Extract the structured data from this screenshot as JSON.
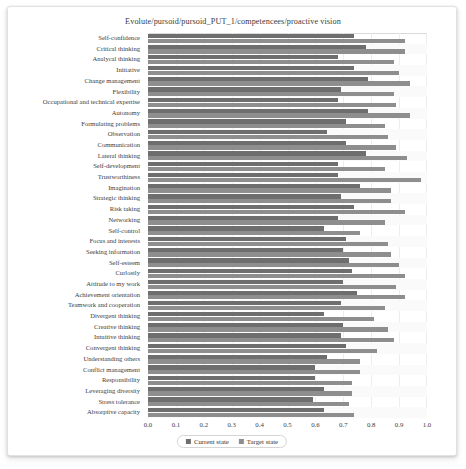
{
  "chart_data": {
    "type": "bar",
    "orientation": "horizontal",
    "title": "Evolute/pursoid/pursoid_PUT_1/competencees/proactive vision",
    "xlabel": "",
    "ylabel": "",
    "xlim": [
      0.0,
      1.0
    ],
    "xticks": [
      "0.0",
      "0.1",
      "0.2",
      "0.3",
      "0.4",
      "0.5",
      "0.6",
      "0.7",
      "0.8",
      "0.9",
      "1.0"
    ],
    "grid": true,
    "legend_position": "bottom-center",
    "legend": [
      "Current state",
      "Target state"
    ],
    "categories": [
      "Self-confidence",
      "Critical thinking",
      "Analycal thinking",
      "Initiative",
      "Change management",
      "Flexibility",
      "Occupational and technical expertise",
      "Autonomy",
      "Formulating problems",
      "Observation",
      "Communication",
      "Lateral thinking",
      "Self-development",
      "Trustworthiness",
      "Imagination",
      "Strategic thinking",
      "Risk taking",
      "Networking",
      "Self-control",
      "Focus and interests",
      "Seeking information",
      "Self-esteem",
      "Curlostly",
      "Attitude to my work",
      "Achievement orientation",
      "Teamwork and cooperation",
      "Divergent thinking",
      "Creative thinking",
      "Intuitive thinking",
      "Convergent thinking",
      "Understanding others",
      "Conflict management",
      "Responsibility",
      "Leveraging diversity",
      "Stress tolerance",
      "Absorptive capacity"
    ],
    "series": [
      {
        "name": "Current state",
        "color": "#6e6e6e",
        "values": [
          0.74,
          0.78,
          0.68,
          0.74,
          0.79,
          0.69,
          0.68,
          0.79,
          0.71,
          0.64,
          0.71,
          0.78,
          0.68,
          0.68,
          0.76,
          0.69,
          0.74,
          0.68,
          0.63,
          0.71,
          0.7,
          0.72,
          0.73,
          0.7,
          0.75,
          0.69,
          0.63,
          0.7,
          0.69,
          0.71,
          0.64,
          0.6,
          0.6,
          0.63,
          0.59,
          0.63
        ]
      },
      {
        "name": "Target state",
        "color": "#8e8e8e",
        "values": [
          0.92,
          0.92,
          0.88,
          0.9,
          0.94,
          0.88,
          0.89,
          0.94,
          0.85,
          0.86,
          0.89,
          0.93,
          0.85,
          0.98,
          0.87,
          0.87,
          0.92,
          0.85,
          0.76,
          0.86,
          0.87,
          0.9,
          0.92,
          0.89,
          0.92,
          0.85,
          0.81,
          0.86,
          0.88,
          0.82,
          0.76,
          0.76,
          0.73,
          0.73,
          0.72,
          0.74
        ]
      }
    ]
  },
  "colors": {
    "current_state": "#6e6e6e",
    "target_state": "#8e8e8e",
    "grid": "#ededed",
    "frame": "#d9d9d9",
    "text": "#3d3d3d"
  }
}
